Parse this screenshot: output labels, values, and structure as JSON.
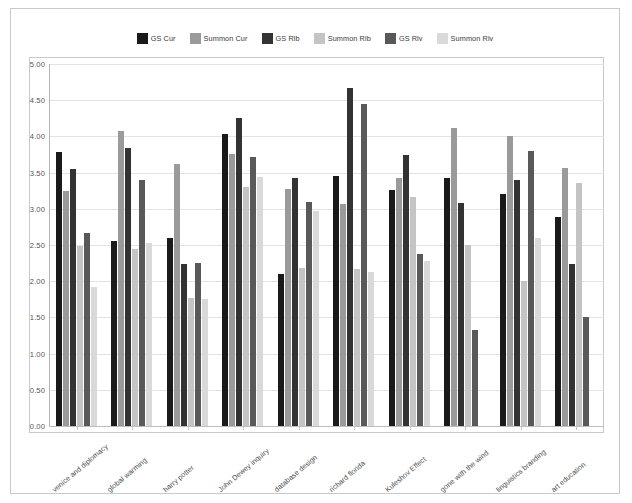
{
  "chart_data": {
    "type": "bar",
    "title": "",
    "subtitle": "",
    "xlabel": "",
    "ylabel": "",
    "ylim": [
      0,
      5
    ],
    "ytick_labels": [
      "0.00",
      "0.50",
      "1.00",
      "1.50",
      "2.00",
      "2.50",
      "3.00",
      "3.50",
      "4.00",
      "4.50",
      "5.00"
    ],
    "ytick_values": [
      0,
      0.5,
      1,
      1.5,
      2,
      2.5,
      3,
      3.5,
      4,
      4.5,
      5
    ],
    "grid": true,
    "legend_position": "top-center",
    "categories": [
      "venice and diplomacy",
      "global warming",
      "harry potter",
      "John Dewey inquiry",
      "database design",
      "richard florida",
      "Kuleshov Effect",
      "gone with the wind",
      "linguistics branding",
      "art education"
    ],
    "series": [
      {
        "name": "GS Cur",
        "color": "#1a1a1a",
        "values": [
          3.79,
          2.55,
          2.6,
          4.03,
          2.1,
          3.46,
          3.26,
          3.42,
          3.21,
          2.89
        ]
      },
      {
        "name": "Summon Cur",
        "color": "#9a9a9a",
        "values": [
          3.24,
          4.08,
          3.62,
          3.76,
          3.28,
          3.06,
          3.42,
          4.12,
          4.01,
          3.56
        ]
      },
      {
        "name": "GS Rlb",
        "color": "#333333",
        "values": [
          3.55,
          3.84,
          2.24,
          4.25,
          3.43,
          4.67,
          3.74,
          3.08,
          3.4,
          2.24
        ]
      },
      {
        "name": "Summon Rlb",
        "color": "#c4c4c4",
        "values": [
          2.49,
          2.45,
          1.77,
          3.3,
          2.18,
          2.17,
          3.16,
          2.5,
          2.0,
          3.35
        ]
      },
      {
        "name": "GS Rlv",
        "color": "#595959",
        "values": [
          2.67,
          3.4,
          2.25,
          3.72,
          3.09,
          4.45,
          2.37,
          1.32,
          3.8,
          1.51
        ]
      },
      {
        "name": "Summon Rlv",
        "color": "#d9d9d9",
        "values": [
          1.92,
          2.53,
          1.76,
          3.44,
          2.97,
          2.13,
          2.28,
          null,
          2.59,
          null
        ]
      }
    ]
  },
  "legend": {
    "items": [
      {
        "label": "GS Cur",
        "color": "#1a1a1a"
      },
      {
        "label": "Summon Cur",
        "color": "#9a9a9a"
      },
      {
        "label": "GS Rlb",
        "color": "#333333"
      },
      {
        "label": "Summon Rlb",
        "color": "#c4c4c4"
      },
      {
        "label": "GS Rlv",
        "color": "#595959"
      },
      {
        "label": "Summon Rlv",
        "color": "#d9d9d9"
      }
    ]
  }
}
